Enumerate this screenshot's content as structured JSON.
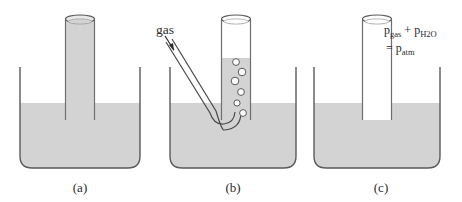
{
  "figure": {
    "background_color": "#ffffff",
    "water_color": "#d3d3d3",
    "outline_color": "#5a5a5a",
    "text_color": "#2b2b2b",
    "bubble_color": "#ffffff"
  },
  "panels": [
    {
      "id": "a",
      "label": "(a)",
      "description": "Inverted tube completely filled with water standing in a beaker of water",
      "tube_contents": "water",
      "water_level_in_tube": "full"
    },
    {
      "id": "b",
      "label": "(b)",
      "description": "Gas delivered through a bent tube bubbles up and displaces water in the collection tube",
      "tube_contents": "gas and water",
      "water_level_in_tube": "partial",
      "gas_label": "gas",
      "bubble_count": 6
    },
    {
      "id": "c",
      "label": "(c)",
      "description": "Tube filled with collected gas; total pressure equals atmospheric pressure",
      "tube_contents": "gas",
      "water_level_in_tube": "empty",
      "equation": {
        "line1_p1": "p",
        "line1_sub1": "gas",
        "line1_plus": " + ",
        "line1_p2": "p",
        "line1_sub2": "H",
        "line1_sub2b": "2",
        "line1_sub2c": "O",
        "line2_equals": "= ",
        "line2_p": "p",
        "line2_sub": "atm",
        "full_text": "p(gas) + p(H2O) = p(atm)"
      }
    }
  ]
}
